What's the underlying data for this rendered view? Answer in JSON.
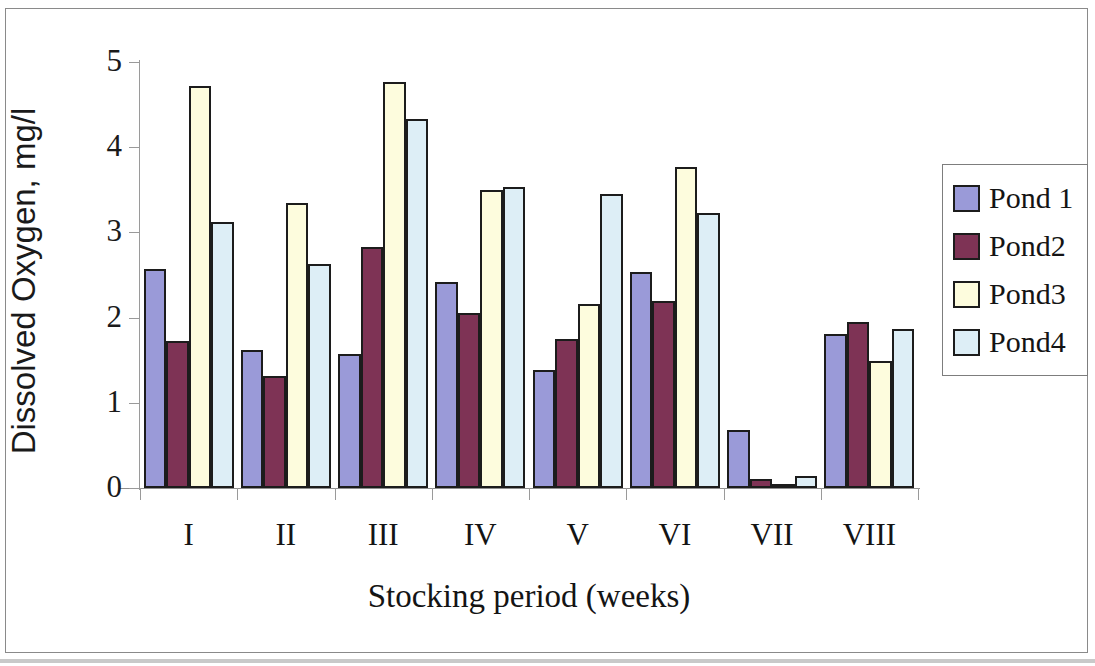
{
  "chart_data": {
    "type": "bar",
    "title": "",
    "xlabel": "Stocking period (weeks)",
    "ylabel": "Dissolved Oxygen, mg/l",
    "categories": [
      "I",
      "II",
      "III",
      "IV",
      "V",
      "VI",
      "VII",
      "VIII"
    ],
    "ylim": [
      0,
      5
    ],
    "yticks": [
      "0",
      "1",
      "2",
      "3",
      "4",
      "5"
    ],
    "grid": false,
    "legend_position": "right",
    "series": [
      {
        "name": "Pond 1",
        "color": "#9a9ad8",
        "values": [
          2.57,
          1.62,
          1.57,
          2.42,
          1.38,
          2.54,
          0.68,
          1.81
        ]
      },
      {
        "name": "Pond2",
        "color": "#7e3355",
        "values": [
          1.72,
          1.32,
          2.83,
          2.05,
          1.75,
          2.19,
          0.11,
          1.95
        ]
      },
      {
        "name": "Pond3",
        "color": "#fdfcdd",
        "values": [
          4.72,
          3.35,
          4.77,
          3.5,
          2.16,
          3.77,
          0.05,
          1.49
        ]
      },
      {
        "name": "Pond4",
        "color": "#ddeef6",
        "values": [
          3.12,
          2.63,
          4.33,
          3.53,
          3.45,
          3.23,
          0.14,
          1.87
        ]
      }
    ]
  },
  "axes": {
    "y_title": "Dissolved Oxygen, mg/l",
    "x_title": "Stocking period (weeks)"
  },
  "legend": {
    "items": [
      {
        "label": "Pond 1",
        "color": "#9a9ad8"
      },
      {
        "label": "Pond2",
        "color": "#7e3355"
      },
      {
        "label": "Pond3",
        "color": "#fdfcdd"
      },
      {
        "label": "Pond4",
        "color": "#ddeef6"
      }
    ]
  },
  "colors": {
    "pond1": "#9a9ad8",
    "pond2": "#7e3355",
    "pond3": "#fdfcdd",
    "pond4": "#ddeef6",
    "bar_outline": "#1c1c1c",
    "axis": "#9a9a9a",
    "text": "#141414",
    "frame": "#8a8a8a"
  }
}
